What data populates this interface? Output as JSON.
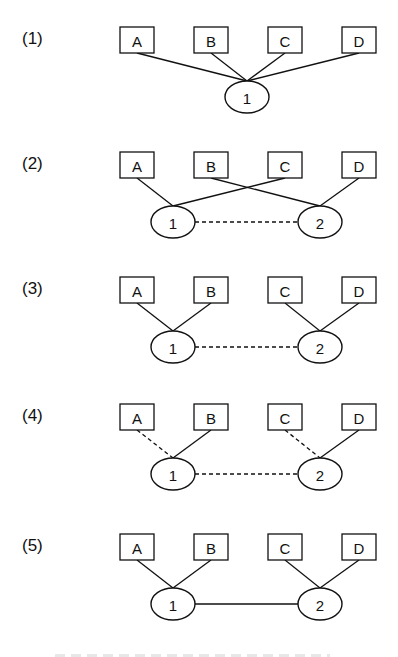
{
  "figure": {
    "type": "network-topology-diagram",
    "node_legend": {
      "square": "terminal/host",
      "ellipse": "switch/router node"
    },
    "colors": {
      "stroke": "#111111",
      "background": "#ffffff"
    },
    "panels": [
      {
        "label": "(1)",
        "y": 40,
        "boxes": [
          "A",
          "B",
          "C",
          "D"
        ],
        "hubs": [
          {
            "id": "1",
            "cx": 247
          }
        ],
        "edges": [
          {
            "from": "A",
            "to": "1",
            "style": "solid"
          },
          {
            "from": "B",
            "to": "1",
            "style": "solid"
          },
          {
            "from": "C",
            "to": "1",
            "style": "solid"
          },
          {
            "from": "D",
            "to": "1",
            "style": "solid"
          }
        ],
        "hub_link": null
      },
      {
        "label": "(2)",
        "y": 165,
        "boxes": [
          "A",
          "B",
          "C",
          "D"
        ],
        "hubs": [
          {
            "id": "1",
            "cx": 173
          },
          {
            "id": "2",
            "cx": 320
          }
        ],
        "edges": [
          {
            "from": "A",
            "to": "1",
            "style": "solid"
          },
          {
            "from": "C",
            "to": "1",
            "style": "solid"
          },
          {
            "from": "B",
            "to": "2",
            "style": "solid"
          },
          {
            "from": "D",
            "to": "2",
            "style": "solid"
          }
        ],
        "hub_link": "dashed"
      },
      {
        "label": "(3)",
        "y": 290,
        "boxes": [
          "A",
          "B",
          "C",
          "D"
        ],
        "hubs": [
          {
            "id": "1",
            "cx": 173
          },
          {
            "id": "2",
            "cx": 320
          }
        ],
        "edges": [
          {
            "from": "A",
            "to": "1",
            "style": "solid"
          },
          {
            "from": "B",
            "to": "1",
            "style": "solid"
          },
          {
            "from": "C",
            "to": "2",
            "style": "solid"
          },
          {
            "from": "D",
            "to": "2",
            "style": "solid"
          }
        ],
        "hub_link": "dashed"
      },
      {
        "label": "(4)",
        "y": 417,
        "boxes": [
          "A",
          "B",
          "C",
          "D"
        ],
        "hubs": [
          {
            "id": "1",
            "cx": 173
          },
          {
            "id": "2",
            "cx": 320
          }
        ],
        "edges": [
          {
            "from": "A",
            "to": "1",
            "style": "dashed"
          },
          {
            "from": "B",
            "to": "1",
            "style": "solid"
          },
          {
            "from": "C",
            "to": "2",
            "style": "dashed"
          },
          {
            "from": "D",
            "to": "2",
            "style": "solid"
          }
        ],
        "hub_link": "dashed"
      },
      {
        "label": "(5)",
        "y": 547,
        "boxes": [
          "A",
          "B",
          "C",
          "D"
        ],
        "hubs": [
          {
            "id": "1",
            "cx": 173
          },
          {
            "id": "2",
            "cx": 320
          }
        ],
        "edges": [
          {
            "from": "A",
            "to": "1",
            "style": "solid"
          },
          {
            "from": "B",
            "to": "1",
            "style": "solid"
          },
          {
            "from": "C",
            "to": "2",
            "style": "solid"
          },
          {
            "from": "D",
            "to": "2",
            "style": "solid"
          }
        ],
        "hub_link": "solid"
      }
    ]
  }
}
